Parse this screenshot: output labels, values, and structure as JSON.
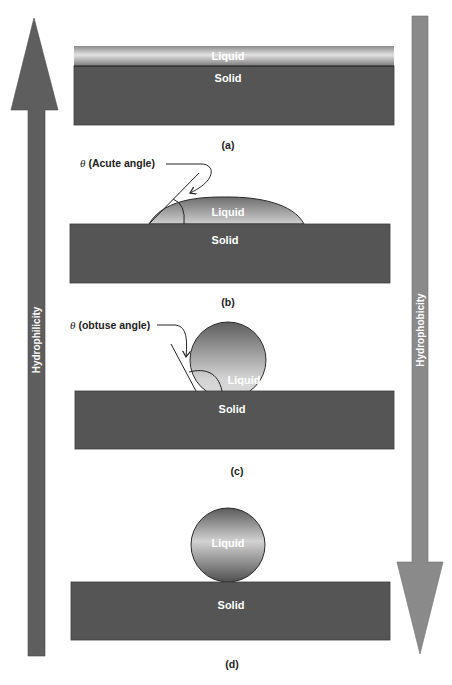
{
  "diagram": {
    "colors": {
      "solid": "#555555",
      "left_arrow": "#5e5e5e",
      "right_arrow": "#8a8a8a",
      "liquid_light": "#d6d6d6",
      "liquid_dark": "#6a6a6a",
      "line": "#222222"
    },
    "axes": {
      "left": {
        "label": "Hydrophilicity",
        "direction": "up"
      },
      "right": {
        "label": "Hydrophobicity",
        "direction": "down"
      }
    },
    "panels": [
      {
        "id": "a",
        "caption": "(a)",
        "liquid_label": "Liquid",
        "solid_label": "Solid",
        "state": "complete wetting (liquid film)"
      },
      {
        "id": "b",
        "caption": "(b)",
        "liquid_label": "Liquid",
        "solid_label": "Solid",
        "angle_symbol": "θ",
        "angle_label": "(Acute angle)"
      },
      {
        "id": "c",
        "caption": "(c)",
        "liquid_label": "Liquid",
        "solid_label": "Solid",
        "angle_symbol": "θ",
        "angle_label": "(obtuse angle)"
      },
      {
        "id": "d",
        "caption": "(d)",
        "liquid_label": "Liquid",
        "solid_label": "Solid",
        "state": "non-wetting (spherical drop)"
      }
    ]
  }
}
